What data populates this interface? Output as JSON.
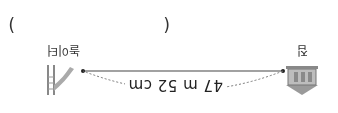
{
  "answer_blank": {
    "open": "(",
    "close": ")"
  },
  "diagram": {
    "start_label": "집",
    "end_label": "놀이터",
    "distance": "47 m 52 cm",
    "start_icon": "house-icon",
    "end_icon": "playground-slide-icon"
  }
}
